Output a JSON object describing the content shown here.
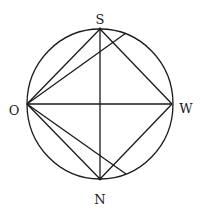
{
  "labels": {
    "top": "S",
    "left": "O",
    "right": "W",
    "bottom": "N"
  },
  "colors": {
    "stroke": "#1a1a1a",
    "background": "#ffffff"
  }
}
